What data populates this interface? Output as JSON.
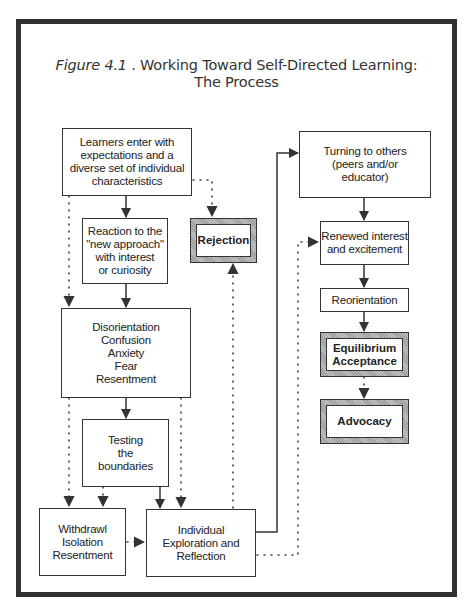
{
  "figure": {
    "label": "Figure 4.1",
    "title_rest": " . Working Toward Self-Directed Learning:",
    "title_line2": "The Process"
  },
  "nodes": {
    "learners": "Learners enter with\nexpectations and a\ndiverse set of individual\ncharacteristics",
    "reaction": "Reaction to the\n\"new approach\"\nwith interest\nor curiosity",
    "rejection": "Rejection",
    "disorientation": "Disorientation\nConfusion\nAnxiety\nFear\nResentment",
    "testing": "Testing\nthe\nboundaries",
    "withdrawl": "Withdrawl\nIsolation\nResentment",
    "individual": "Individual\nExploration and\nReflection",
    "turning": "Turning to others\n(peers and/or\neducator)",
    "renewed": "Renewed interest\nand excitement",
    "reorientation": "Reorientation",
    "equilibrium": "Equilibrium\nAcceptance",
    "advocacy": "Advocacy"
  },
  "edges": [
    {
      "from": "learners",
      "to": "reaction",
      "style": "solid"
    },
    {
      "from": "learners",
      "to": "rejection",
      "style": "dotted"
    },
    {
      "from": "learners",
      "to": "disorientation",
      "style": "dotted"
    },
    {
      "from": "reaction",
      "to": "disorientation",
      "style": "solid"
    },
    {
      "from": "disorientation",
      "to": "testing",
      "style": "solid"
    },
    {
      "from": "disorientation",
      "to": "withdrawl",
      "style": "dotted"
    },
    {
      "from": "disorientation",
      "to": "individual",
      "style": "dotted"
    },
    {
      "from": "testing",
      "to": "withdrawl",
      "style": "dotted"
    },
    {
      "from": "testing",
      "to": "individual",
      "style": "solid"
    },
    {
      "from": "withdrawl",
      "to": "individual",
      "style": "dotted"
    },
    {
      "from": "individual",
      "to": "rejection",
      "style": "dotted"
    },
    {
      "from": "individual",
      "to": "turning",
      "style": "solid"
    },
    {
      "from": "individual",
      "to": "renewed",
      "style": "dotted"
    },
    {
      "from": "turning",
      "to": "renewed",
      "style": "solid"
    },
    {
      "from": "renewed",
      "to": "reorientation",
      "style": "solid"
    },
    {
      "from": "reorientation",
      "to": "equilibrium",
      "style": "solid"
    },
    {
      "from": "equilibrium",
      "to": "advocacy",
      "style": "dotted"
    }
  ],
  "colors": {
    "frame": "#333333",
    "line": "#333333",
    "shade": "#b0b0b0"
  }
}
